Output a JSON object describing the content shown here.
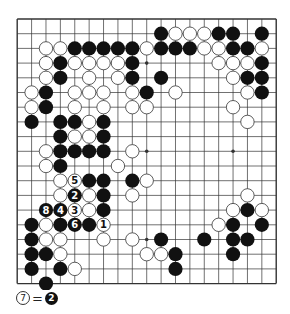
{
  "board": {
    "size": 19,
    "origin_x": 17.2,
    "origin_y": 19.0,
    "spacing_x": 14.39,
    "spacing_y": 14.7,
    "stone_radius": 7.1,
    "line_color": "#333333",
    "background": "#ffffff",
    "black_color": "#111111",
    "white_fill": "#ffffff",
    "white_stroke": "#333333",
    "star_points": [
      [
        3,
        3
      ],
      [
        3,
        9
      ],
      [
        3,
        15
      ],
      [
        9,
        3
      ],
      [
        9,
        9
      ],
      [
        9,
        15
      ],
      [
        15,
        3
      ],
      [
        15,
        9
      ],
      [
        15,
        15
      ]
    ]
  },
  "stones": {
    "black": [
      [
        1,
        10
      ],
      [
        1,
        14
      ],
      [
        1,
        15
      ],
      [
        1,
        17
      ],
      [
        2,
        4
      ],
      [
        2,
        5
      ],
      [
        2,
        6
      ],
      [
        2,
        7
      ],
      [
        2,
        8
      ],
      [
        2,
        10
      ],
      [
        2,
        11
      ],
      [
        2,
        12
      ],
      [
        2,
        15
      ],
      [
        2,
        16
      ],
      [
        3,
        3
      ],
      [
        3,
        8
      ],
      [
        3,
        17
      ],
      [
        4,
        3
      ],
      [
        4,
        8
      ],
      [
        4,
        10
      ],
      [
        4,
        16
      ],
      [
        4,
        17
      ],
      [
        5,
        2
      ],
      [
        5,
        9
      ],
      [
        5,
        17
      ],
      [
        6,
        2
      ],
      [
        7,
        1
      ],
      [
        7,
        3
      ],
      [
        7,
        4
      ],
      [
        7,
        6
      ],
      [
        8,
        3
      ],
      [
        8,
        6
      ],
      [
        9,
        3
      ],
      [
        9,
        4
      ],
      [
        9,
        5
      ],
      [
        9,
        6
      ],
      [
        10,
        3
      ],
      [
        11,
        5
      ],
      [
        11,
        6
      ],
      [
        11,
        8
      ],
      [
        12,
        6
      ],
      [
        13,
        6
      ],
      [
        13,
        16
      ],
      [
        14,
        1
      ],
      [
        14,
        3
      ],
      [
        14,
        5
      ],
      [
        14,
        15
      ],
      [
        14,
        17
      ],
      [
        15,
        1
      ],
      [
        15,
        10
      ],
      [
        15,
        13
      ],
      [
        15,
        15
      ],
      [
        15,
        16
      ],
      [
        16,
        1
      ],
      [
        16,
        2
      ],
      [
        16,
        11
      ],
      [
        16,
        15
      ],
      [
        17,
        1
      ],
      [
        17,
        3
      ],
      [
        17,
        11
      ],
      [
        18,
        2
      ]
    ],
    "white": [
      [
        1,
        11
      ],
      [
        1,
        12
      ],
      [
        1,
        13
      ],
      [
        2,
        2
      ],
      [
        2,
        3
      ],
      [
        2,
        9
      ],
      [
        2,
        13
      ],
      [
        2,
        14
      ],
      [
        2,
        17
      ],
      [
        3,
        2
      ],
      [
        3,
        4
      ],
      [
        3,
        5
      ],
      [
        3,
        6
      ],
      [
        3,
        7
      ],
      [
        3,
        14
      ],
      [
        3,
        15
      ],
      [
        3,
        16
      ],
      [
        4,
        2
      ],
      [
        4,
        5
      ],
      [
        4,
        7
      ],
      [
        4,
        15
      ],
      [
        5,
        1
      ],
      [
        5,
        4
      ],
      [
        5,
        5
      ],
      [
        5,
        6
      ],
      [
        5,
        8
      ],
      [
        5,
        11
      ],
      [
        5,
        16
      ],
      [
        6,
        1
      ],
      [
        6,
        4
      ],
      [
        6,
        6
      ],
      [
        6,
        8
      ],
      [
        6,
        9
      ],
      [
        6,
        15
      ],
      [
        7,
        5
      ],
      [
        7,
        16
      ],
      [
        8,
        4
      ],
      [
        8,
        5
      ],
      [
        9,
        2
      ],
      [
        9,
        8
      ],
      [
        10,
        2
      ],
      [
        10,
        7
      ],
      [
        11,
        3
      ],
      [
        11,
        9
      ],
      [
        12,
        3
      ],
      [
        12,
        5
      ],
      [
        12,
        8
      ],
      [
        12,
        16
      ],
      [
        13,
        5
      ],
      [
        13,
        15
      ],
      [
        13,
        17
      ],
      [
        14,
        2
      ],
      [
        14,
        14
      ],
      [
        15,
        2
      ],
      [
        15,
        3
      ],
      [
        15,
        6
      ],
      [
        15,
        8
      ],
      [
        16,
        3
      ],
      [
        16,
        9
      ],
      [
        16,
        10
      ],
      [
        17,
        4
      ]
    ],
    "numbered": [
      {
        "row": 14,
        "col": 6,
        "color": "white",
        "label": "1"
      },
      {
        "row": 12,
        "col": 4,
        "color": "black",
        "label": "2"
      },
      {
        "row": 13,
        "col": 4,
        "color": "white",
        "label": "3"
      },
      {
        "row": 13,
        "col": 3,
        "color": "black",
        "label": "4"
      },
      {
        "row": 11,
        "col": 4,
        "color": "white",
        "label": "5"
      },
      {
        "row": 14,
        "col": 4,
        "color": "black",
        "label": "6"
      },
      {
        "row": 13,
        "col": 2,
        "color": "black",
        "label": "8"
      }
    ]
  },
  "caption": {
    "move_white_label": "7",
    "equals": "=",
    "move_black_label": "2"
  }
}
